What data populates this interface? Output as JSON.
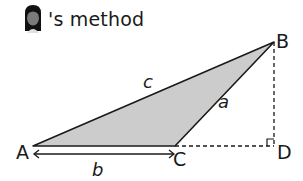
{
  "header": {
    "title": "'s method",
    "avatar_icon": "girl-avatar-icon"
  },
  "diagram": {
    "vertices": {
      "A": "A",
      "B": "B",
      "C": "C",
      "D": "D"
    },
    "sides": {
      "a": "a",
      "b": "b",
      "c": "c"
    },
    "fill_color": "#cccccc",
    "stroke_color": "#1a1a1a",
    "right_angle_at": "D"
  }
}
